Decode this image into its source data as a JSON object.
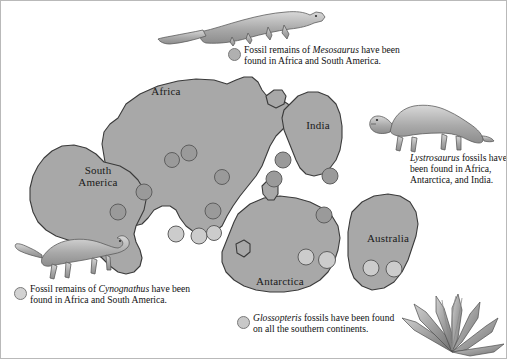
{
  "figure": {
    "background_color": "#ffffff",
    "landmass_fill": "#a8a8a8",
    "landmass_stroke": "#3a3a3a",
    "border_color": "#b9b9b9"
  },
  "continents": [
    {
      "name": "Africa",
      "label": "Africa"
    },
    {
      "name": "South America",
      "label": "South\nAmerica"
    },
    {
      "name": "India",
      "label": "India"
    },
    {
      "name": "Antarctica",
      "label": "Antarctica"
    },
    {
      "name": "Australia",
      "label": "Australia"
    }
  ],
  "captions": [
    {
      "id": "mesosaurus",
      "marker_color": "#b0b0b0",
      "lines": [
        {
          "text": "Fossil remains of ",
          "italic": false
        },
        {
          "text": "Mesosaurus",
          "italic": true
        },
        {
          "text": " have been found in Africa and South America.",
          "italic": false
        }
      ],
      "plain": "Fossil remains of Mesosaurus have been found in Africa and South America."
    },
    {
      "id": "lystrosaurus",
      "marker_color": null,
      "lines": [
        {
          "text": "Lystrosaurus",
          "italic": true
        },
        {
          "text": " fossils have been found in Africa, Antarctica, and India.",
          "italic": false
        }
      ],
      "plain": "Lystrosaurus fossils have been found in Africa, Antarctica, and India."
    },
    {
      "id": "cynognathus",
      "marker_color": "#d2d2d2",
      "lines": [
        {
          "text": "Fossil remains of ",
          "italic": false
        },
        {
          "text": "Cynognathus",
          "italic": true
        },
        {
          "text": " have been found in Africa and South America.",
          "italic": false
        }
      ],
      "plain": "Fossil remains of Cynognathus have been found in Africa and South America."
    },
    {
      "id": "glossopteris",
      "marker_color": "#c8c8c8",
      "lines": [
        {
          "text": "Glossopteris",
          "italic": true
        },
        {
          "text": " fossils have been found on all the southern continents.",
          "italic": false
        }
      ],
      "plain": "Glossopteris fossils have been found on all the southern continents."
    }
  ],
  "organisms": [
    {
      "id": "mesosaurus-illustration",
      "name": "Mesosaurus",
      "kind": "aquatic-reptile"
    },
    {
      "id": "lystrosaurus-illustration",
      "name": "Lystrosaurus",
      "kind": "land-reptile"
    },
    {
      "id": "cynognathus-illustration",
      "name": "Cynognathus",
      "kind": "land-reptile"
    },
    {
      "id": "glossopteris-illustration",
      "name": "Glossopteris",
      "kind": "plant"
    }
  ],
  "fossil_markers": {
    "dark_fill": "#9a9a9a",
    "light_fill": "#cccccc",
    "stroke": "#5e5e5e",
    "points": [
      {
        "x": 189,
        "y": 153,
        "r": 8,
        "fill": "dark"
      },
      {
        "x": 172,
        "y": 160,
        "r": 7.5,
        "fill": "dark"
      },
      {
        "x": 222,
        "y": 177,
        "r": 7.5,
        "fill": "dark"
      },
      {
        "x": 144,
        "y": 192,
        "r": 8,
        "fill": "dark"
      },
      {
        "x": 118,
        "y": 212,
        "r": 8,
        "fill": "dark"
      },
      {
        "x": 213,
        "y": 211,
        "r": 8,
        "fill": "dark"
      },
      {
        "x": 283,
        "y": 160,
        "r": 8,
        "fill": "dark"
      },
      {
        "x": 330,
        "y": 176,
        "r": 8,
        "fill": "dark"
      },
      {
        "x": 274,
        "y": 179,
        "r": 8,
        "fill": "dark"
      },
      {
        "x": 324,
        "y": 215,
        "r": 8,
        "fill": "dark"
      },
      {
        "x": 176,
        "y": 234,
        "r": 8,
        "fill": "light"
      },
      {
        "x": 199,
        "y": 236,
        "r": 8,
        "fill": "light"
      },
      {
        "x": 214,
        "y": 233,
        "r": 7.5,
        "fill": "light"
      },
      {
        "x": 306,
        "y": 257,
        "r": 8,
        "fill": "light"
      },
      {
        "x": 327,
        "y": 260,
        "r": 8.5,
        "fill": "light"
      },
      {
        "x": 371,
        "y": 268,
        "r": 8,
        "fill": "light"
      },
      {
        "x": 394,
        "y": 269,
        "r": 8,
        "fill": "light"
      }
    ]
  }
}
